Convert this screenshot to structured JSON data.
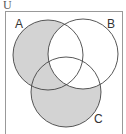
{
  "diagram": {
    "type": "venn",
    "universe_label": "U",
    "sets": [
      {
        "name": "A",
        "label": "A"
      },
      {
        "name": "B",
        "label": "B"
      },
      {
        "name": "C",
        "label": "C"
      }
    ],
    "shaded_region": "(A ∪ C) − B",
    "colors": {
      "shade": "#d3d3d3",
      "stroke": "#444444",
      "frame": "#999999"
    }
  }
}
